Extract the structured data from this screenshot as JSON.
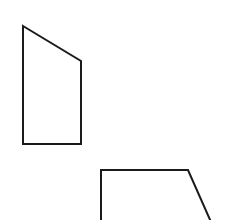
{
  "canvas": {
    "width": 226,
    "height": 220,
    "background": "#ffffff"
  },
  "style": {
    "stroke": "#1a1a1a",
    "stroke_width": 2,
    "fill": "none"
  },
  "shapes": [
    {
      "name": "upper-quadrilateral",
      "type": "polygon",
      "points": [
        [
          23,
          26
        ],
        [
          81,
          61
        ],
        [
          81,
          144
        ],
        [
          23,
          144
        ]
      ]
    },
    {
      "name": "lower-quadrilateral",
      "type": "polyline",
      "points": [
        [
          101,
          222
        ],
        [
          101,
          170
        ],
        [
          188,
          170
        ],
        [
          211,
          222
        ]
      ]
    }
  ]
}
